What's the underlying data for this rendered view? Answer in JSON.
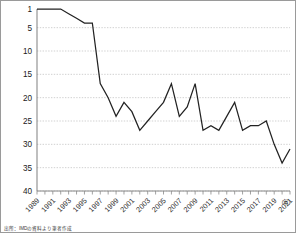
{
  "chart_data": {
    "type": "line",
    "title": "",
    "xlabel": "(年)",
    "ylabel": "",
    "grid": true,
    "legend": "none",
    "y_inverted": true,
    "ylim": [
      1,
      40
    ],
    "yticks": [
      1,
      5,
      10,
      15,
      20,
      25,
      30,
      35,
      40
    ],
    "xlim": [
      1989,
      2021
    ],
    "xticks": [
      1989,
      1991,
      1993,
      1995,
      1997,
      1999,
      2001,
      2003,
      2005,
      2007,
      2009,
      2011,
      2013,
      2015,
      2017,
      2019,
      2021
    ],
    "x": [
      1989,
      1990,
      1991,
      1992,
      1993,
      1994,
      1995,
      1996,
      1997,
      1998,
      1999,
      2000,
      2001,
      2002,
      2003,
      2004,
      2005,
      2006,
      2007,
      2008,
      2009,
      2010,
      2011,
      2012,
      2013,
      2014,
      2015,
      2016,
      2017,
      2018,
      2019,
      2020,
      2021
    ],
    "series": [
      {
        "name": "日本の国際競争力順位",
        "values": [
          1,
          1,
          1,
          1,
          2,
          3,
          4,
          4,
          17,
          20,
          24,
          21,
          23,
          27,
          25,
          23,
          21,
          17,
          24,
          22,
          17,
          27,
          26,
          27,
          24,
          21,
          27,
          26,
          26,
          25,
          30,
          34,
          31
        ],
        "color": "#222222"
      }
    ]
  },
  "yticks_text": [
    "1",
    "5",
    "10",
    "15",
    "20",
    "25",
    "30",
    "35",
    "40"
  ],
  "xticks_text": [
    "1989",
    "1991",
    "1993",
    "1995",
    "1997",
    "1999",
    "2001",
    "2003",
    "2005",
    "2007",
    "2009",
    "2011",
    "2013",
    "2015",
    "2017",
    "2019",
    "2021"
  ],
  "axis_unit": "(年)",
  "caption": "出所：IMDの資料より筆者作成",
  "colors": {
    "line": "#222222",
    "grid": "#bdbdbd",
    "axis": "#8a8a8a",
    "border": "#9a9a9a",
    "text": "#1a1a1a"
  }
}
